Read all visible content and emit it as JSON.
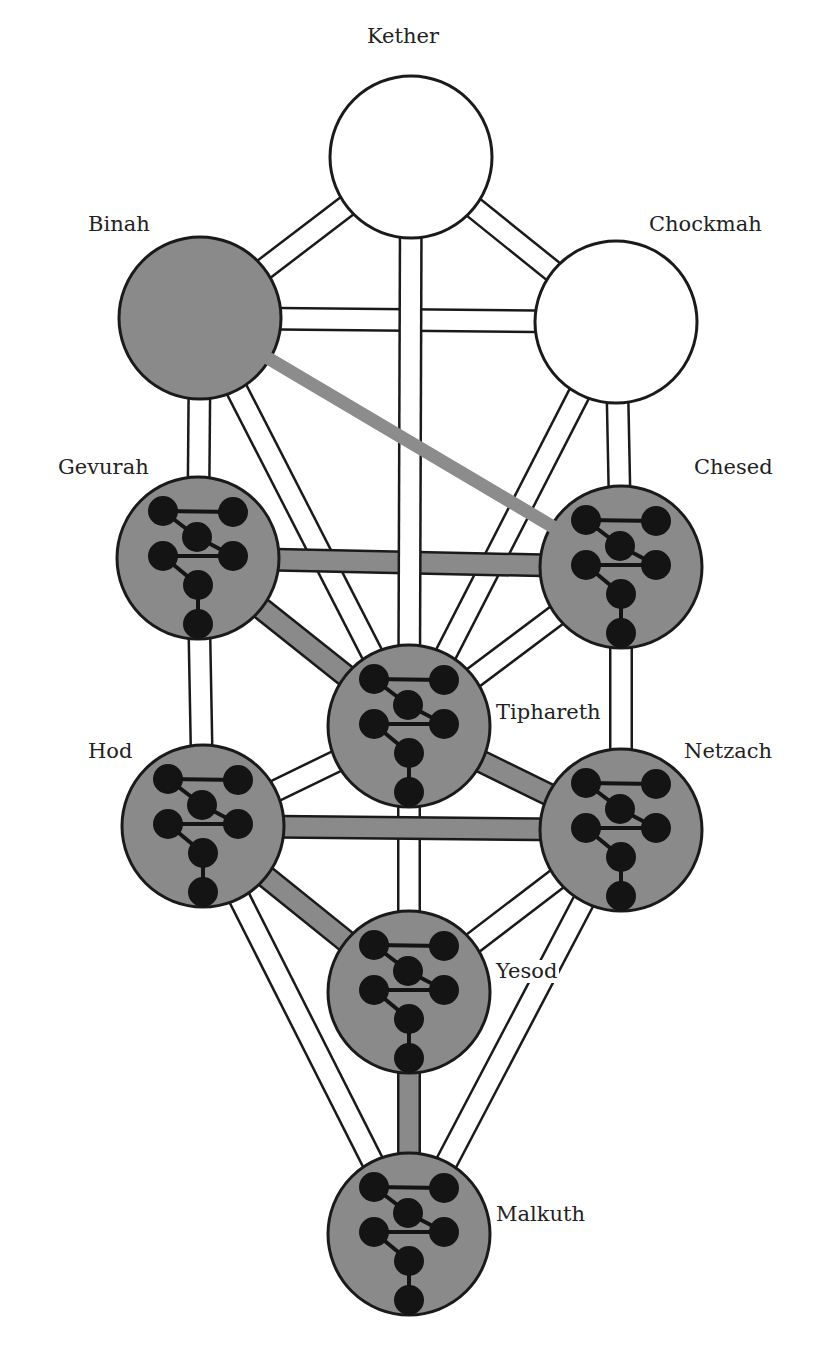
{
  "diagram": {
    "colors": {
      "background": "#ffffff",
      "stroke": "#1a1a1a",
      "gray_fill": "#8a8a8a",
      "white_fill": "#ffffff",
      "dot_fill": "#141414",
      "highlight_path": "#8c8c8c"
    },
    "node_radius": 81,
    "path_width": 20,
    "nodes": [
      {
        "id": "kether",
        "label": "Kether",
        "x": 411,
        "y": 157,
        "fill": "white",
        "inner_network": false,
        "label_x": 365,
        "label_y": 25
      },
      {
        "id": "binah",
        "label": "Binah",
        "x": 200,
        "y": 318,
        "fill": "gray",
        "inner_network": false,
        "label_x": 86,
        "label_y": 213
      },
      {
        "id": "chockmah",
        "label": "Chockmah",
        "x": 616,
        "y": 322,
        "fill": "white",
        "inner_network": false,
        "label_x": 647,
        "label_y": 213
      },
      {
        "id": "gevurah",
        "label": "Gevurah",
        "x": 198,
        "y": 558,
        "fill": "gray",
        "inner_network": true,
        "label_x": 56,
        "label_y": 456
      },
      {
        "id": "chesed",
        "label": "Chesed",
        "x": 621,
        "y": 567,
        "fill": "gray",
        "inner_network": true,
        "label_x": 692,
        "label_y": 456
      },
      {
        "id": "tiphareth",
        "label": "Tiphareth",
        "x": 409,
        "y": 726,
        "fill": "gray",
        "inner_network": true,
        "label_x": 494,
        "label_y": 701
      },
      {
        "id": "hod",
        "label": "Hod",
        "x": 203,
        "y": 826,
        "fill": "gray",
        "inner_network": true,
        "label_x": 86,
        "label_y": 740
      },
      {
        "id": "netzach",
        "label": "Netzach",
        "x": 621,
        "y": 830,
        "fill": "gray",
        "inner_network": true,
        "label_x": 682,
        "label_y": 740
      },
      {
        "id": "yesod",
        "label": "Yesod",
        "x": 409,
        "y": 992,
        "fill": "gray",
        "inner_network": true,
        "label_x": 494,
        "label_y": 960
      },
      {
        "id": "malkuth",
        "label": "Malkuth",
        "x": 409,
        "y": 1234,
        "fill": "gray",
        "inner_network": true,
        "label_x": 494,
        "label_y": 1203
      }
    ],
    "paths": [
      {
        "from": "kether",
        "to": "binah",
        "style": "white"
      },
      {
        "from": "kether",
        "to": "chockmah",
        "style": "white"
      },
      {
        "from": "binah",
        "to": "chockmah",
        "style": "white"
      },
      {
        "from": "binah",
        "to": "gevurah",
        "style": "white"
      },
      {
        "from": "chockmah",
        "to": "chesed",
        "style": "white"
      },
      {
        "from": "binah",
        "to": "tiphareth",
        "style": "white"
      },
      {
        "from": "chockmah",
        "to": "tiphareth",
        "style": "white"
      },
      {
        "from": "gevurah",
        "to": "hod",
        "style": "white"
      },
      {
        "from": "chesed",
        "to": "netzach",
        "style": "white"
      },
      {
        "from": "chesed",
        "to": "tiphareth",
        "style": "white"
      },
      {
        "from": "gevurah",
        "to": "tiphareth",
        "style": "gray"
      },
      {
        "from": "gevurah",
        "to": "chesed",
        "style": "gray"
      },
      {
        "from": "kether",
        "to": "tiphareth",
        "style": "white"
      },
      {
        "from": "hod",
        "to": "tiphareth",
        "style": "white"
      },
      {
        "from": "netzach",
        "to": "tiphareth",
        "style": "gray"
      },
      {
        "from": "hod",
        "to": "netzach",
        "style": "gray"
      },
      {
        "from": "hod",
        "to": "malkuth",
        "style": "white"
      },
      {
        "from": "netzach",
        "to": "malkuth",
        "style": "white"
      },
      {
        "from": "hod",
        "to": "yesod",
        "style": "gray"
      },
      {
        "from": "netzach",
        "to": "yesod",
        "style": "white"
      },
      {
        "from": "tiphareth",
        "to": "yesod",
        "style": "white"
      },
      {
        "from": "yesod",
        "to": "malkuth",
        "style": "gray"
      }
    ],
    "highlight_path": {
      "from": "binah",
      "to": "chesed",
      "width": 13
    },
    "inner_network": {
      "dot_radius": 15,
      "dots": [
        [
          -35,
          -47
        ],
        [
          35,
          -46
        ],
        [
          -1,
          -21
        ],
        [
          -35,
          -2
        ],
        [
          35,
          -2
        ],
        [
          0,
          27
        ],
        [
          0,
          66
        ]
      ],
      "links": [
        [
          0,
          1
        ],
        [
          0,
          2
        ],
        [
          2,
          4
        ],
        [
          3,
          4
        ],
        [
          3,
          5
        ],
        [
          5,
          6
        ]
      ]
    }
  }
}
